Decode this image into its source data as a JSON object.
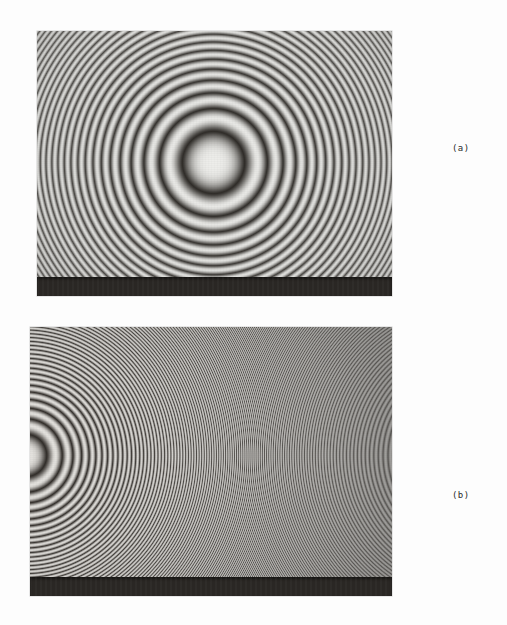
{
  "page": {
    "background_color": "#fdfdfd",
    "width": 507,
    "height": 625,
    "kind": "scanned-figure-plate"
  },
  "panels": [
    {
      "id": "panel-a",
      "label": "(a)",
      "label_x": 452,
      "label_y": 143,
      "frame": {
        "x": 37,
        "y": 31,
        "w": 355,
        "h": 265
      },
      "photo_area": {
        "x": 37,
        "y": 31,
        "w": 355,
        "h": 246
      },
      "dark_band": {
        "height": 19,
        "color": "#2a2724"
      },
      "paper_tone": "#ededea",
      "fringe_color": "#2f2c28",
      "pattern": {
        "type": "concentric-circular-interference-fringes",
        "center_x": 213,
        "center_y": 162,
        "center_x_rel": 0.496,
        "center_y_rel": 0.533,
        "first_dark_ring_radius_px": 44,
        "ring_spacing_law": "sqrt",
        "visible_ring_count": 22,
        "fringe_density": "low-to-moderate",
        "center_is_bright": true,
        "notes": "Newton's-ring type pattern, centre well inside the frame"
      }
    },
    {
      "id": "panel-b",
      "label": "(b)",
      "label_x": 452,
      "label_y": 490,
      "frame": {
        "x": 30,
        "y": 327,
        "w": 362,
        "h": 269
      },
      "photo_area": {
        "x": 30,
        "y": 327,
        "w": 362,
        "h": 250
      },
      "dark_band": {
        "height": 19,
        "color": "#2a2724"
      },
      "paper_tone": "#e6e4e0",
      "fringe_color": "#332f2b",
      "pattern": {
        "type": "concentric-circular-interference-fringes",
        "center_x": 25,
        "center_y": 455,
        "center_x_rel": -0.014,
        "center_y_rel": 0.512,
        "first_dark_ring_radius_px": 30,
        "ring_spacing_law": "sqrt",
        "visible_ring_count": 58,
        "fringe_density": "high, crowding toward right edge",
        "center_is_bright": true,
        "notes": "Same fringe system at much higher order; centre lies on/off the left border so only right-hand arcs are seen"
      }
    }
  ],
  "colors": {
    "paper": "#fdfdfd",
    "photo_light": "#ededea",
    "photo_dark": "#2f2c28",
    "band": "#2a2724",
    "label_text": "#2b2b2b"
  }
}
